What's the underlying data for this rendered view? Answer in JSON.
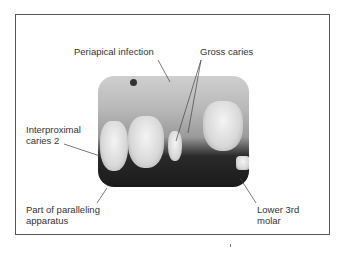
{
  "figure": {
    "type": "annotated dental radiograph",
    "labels": {
      "periapical_infection": "Periapical infection",
      "gross_caries": "Gross caries",
      "interproximal_caries_line1": "Interproximal",
      "interproximal_caries_line2": "caries 2",
      "paralleling_line1": "Part of paralleling",
      "paralleling_line2": "apparatus",
      "lower_molar_line1": "Lower 3rd",
      "lower_molar_line2": "molar"
    }
  }
}
